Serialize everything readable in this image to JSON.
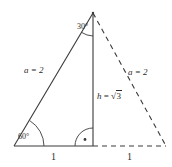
{
  "figure": {
    "stroke_color": "#3a3a3a",
    "background": "#ffffff",
    "labels": {
      "apex_angle": "30°",
      "base_angle": "60°",
      "left_side": "a = 2",
      "right_side": "a = 2",
      "height_var": "h",
      "height_eq": "=",
      "height_radical": "√",
      "height_radicand": "3",
      "base_left": "1",
      "base_right": "1"
    },
    "marks": {
      "right_angle": "right-angle-dot",
      "apex_arc": "angle-arc",
      "base_arc": "angle-arc"
    }
  },
  "geometry": {
    "apex": [
      93,
      13
    ],
    "bottom_left": [
      14,
      146
    ],
    "foot": [
      93,
      146
    ],
    "bottom_right": [
      166,
      146
    ],
    "solid_edges": [
      "apex-bottom_left",
      "apex-foot",
      "bottom_left-foot"
    ],
    "dashed_edges": [
      "apex-bottom_right",
      "foot-bottom_right"
    ]
  }
}
